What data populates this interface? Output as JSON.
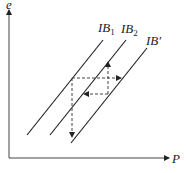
{
  "diagram": {
    "axes": {
      "y_label": "e",
      "x_label": "P"
    },
    "curves": [
      {
        "label": "IB",
        "sub": "1",
        "x1": 27,
        "y1": 135,
        "x2": 103,
        "y2": 40
      },
      {
        "label": "IB",
        "sub": "2",
        "x1": 50,
        "y1": 135,
        "x2": 126,
        "y2": 40
      },
      {
        "label": "IB",
        "sub": "′",
        "x1": 71,
        "y1": 143,
        "x2": 147,
        "y2": 48
      }
    ],
    "curve_labels": {
      "ib1": "IB",
      "ib1_sub": "1",
      "ib2": "IB",
      "ib2_sub": "2",
      "ibprime": "IB′"
    },
    "colors": {
      "line": "#222222",
      "dashed": "#444444"
    }
  }
}
